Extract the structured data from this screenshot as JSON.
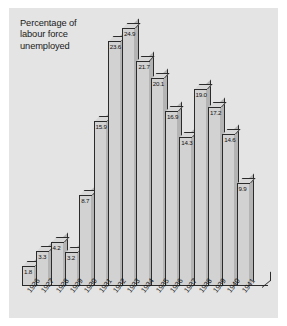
{
  "figure": {
    "title": "Percentage of\nlabour force\nunemployed",
    "background_color": "#e4e4e4",
    "bar_face_color": "#d2d2d2",
    "bar_top_color": "#d8d8d8",
    "bar_side_color": "#b4b4b4",
    "outline_color": "#2b2b2b"
  },
  "chart_data": {
    "type": "bar",
    "title": "Percentage of labour force unemployed",
    "xlabel": "",
    "ylabel": "Percentage of labour force unemployed",
    "ylim": [
      0,
      24.9
    ],
    "grid": false,
    "legend": "none",
    "style": "3d-bar",
    "categories": [
      "1926",
      "1927",
      "1928",
      "1929",
      "1930",
      "1931",
      "1932",
      "1933",
      "1934",
      "1935",
      "1936",
      "1937",
      "1938",
      "1939",
      "1940",
      "1941"
    ],
    "values": [
      1.8,
      3.3,
      4.2,
      3.2,
      8.7,
      15.9,
      23.6,
      24.9,
      21.7,
      20.1,
      16.9,
      14.3,
      19.0,
      17.2,
      14.6,
      9.9
    ],
    "value_labels": [
      "1.8",
      "3.3",
      "4.2",
      "3.2",
      "8.7",
      "15.9",
      "23.6",
      "24.9",
      "21.7",
      "20.1",
      "16.9",
      "14.3",
      "19.0",
      "17.2",
      "14.6",
      "9.9"
    ]
  }
}
